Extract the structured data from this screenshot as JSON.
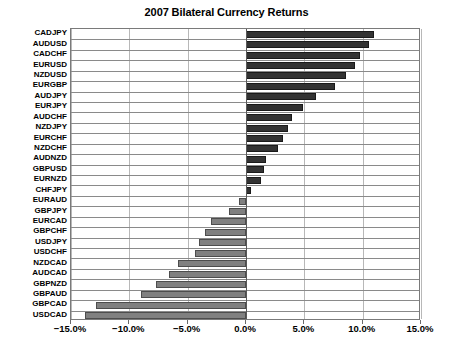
{
  "chart_data": {
    "type": "bar",
    "orientation": "horizontal",
    "title": "2007 Bilateral Currency Returns",
    "xlabel": "",
    "ylabel": "",
    "xlim": [
      -15.0,
      15.0
    ],
    "xticks": [
      -15.0,
      -10.0,
      -5.0,
      0.0,
      5.0,
      10.0,
      15.0
    ],
    "xtick_labels": [
      "−15.0%",
      "−10.0%",
      "−5.0%",
      "0.0%",
      "5.0%",
      "10.0%",
      "15.0%"
    ],
    "grid": true,
    "legend": "none",
    "value_suffix": "%",
    "categories": [
      "CADJPY",
      "AUDUSD",
      "CADCHF",
      "EURUSD",
      "NZDUSD",
      "EURGBP",
      "AUDJPY",
      "EURJPY",
      "AUDCHF",
      "NZDJPY",
      "EURCHF",
      "NZDCHF",
      "AUDNZD",
      "GBPUSD",
      "EURNZD",
      "CHFJPY",
      "EURAUD",
      "GBPJPY",
      "EURCAD",
      "GBPCHF",
      "USDJPY",
      "USDCHF",
      "NZDCAD",
      "AUDCAD",
      "GBPNZD",
      "GBPAUD",
      "GBPCAD",
      "USDCAD"
    ],
    "values": [
      11.0,
      10.5,
      9.8,
      9.3,
      8.6,
      7.6,
      6.0,
      4.9,
      3.9,
      3.6,
      3.2,
      2.7,
      1.7,
      1.5,
      1.3,
      0.4,
      -0.6,
      -1.5,
      -3.0,
      -3.5,
      -4.0,
      -4.4,
      -5.8,
      -6.6,
      -7.7,
      -9.0,
      -12.9,
      -13.8
    ],
    "positive_color": "#333333",
    "negative_color": "#808080"
  },
  "axis": {
    "zero_label": "0.0%"
  }
}
